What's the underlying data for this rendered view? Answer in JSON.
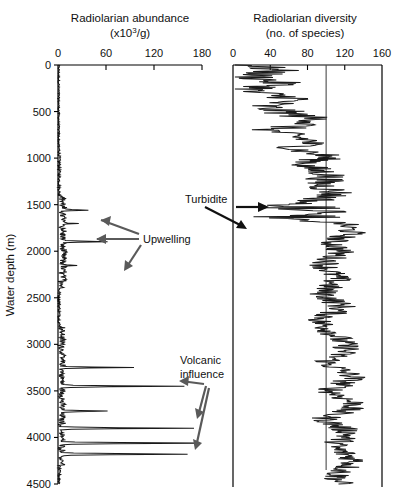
{
  "figure": {
    "depth_axis_label": "Water depth (m)",
    "depth_ticks": [
      0,
      500,
      1000,
      1500,
      2000,
      2500,
      3000,
      3500,
      4000,
      4500
    ]
  },
  "panels": {
    "left": {
      "title_line1": "Radiolarian abundance",
      "title_line2_pre": "(x10",
      "title_line2_sup": "3",
      "title_line2_post": "/g)",
      "ticks": [
        0,
        60,
        120,
        180
      ]
    },
    "right": {
      "title_line1": "Radiolarian diversity",
      "title_line2": "(no. of species)",
      "ticks": [
        0,
        40,
        80,
        120,
        160
      ]
    }
  },
  "annotations": [
    {
      "name": "upwelling",
      "label": "Upwelling",
      "x": 143,
      "y": 239
    },
    {
      "name": "volcanic-influence",
      "label_line1": "Volcanic",
      "label_line2": "influence",
      "x": 180,
      "y": 361
    },
    {
      "name": "turbidite",
      "label": "Turbidite",
      "x": 185,
      "y": 200
    }
  ],
  "chart_data": [
    {
      "type": "line",
      "name": "radiolarian-abundance",
      "title": "Radiolarian abundance (x10^3/g)",
      "xlabel": "Radiolarian abundance (x10^3/g)",
      "ylabel": "Water depth (m)",
      "xlim": [
        0,
        180
      ],
      "ylim": [
        0,
        4500
      ],
      "y_inverted": true,
      "grid": false,
      "legend": "none",
      "x": [
        0,
        0,
        1,
        2,
        1,
        0,
        10,
        16,
        8,
        2,
        0,
        1,
        0,
        6,
        3,
        0,
        2,
        1,
        0,
        4,
        2,
        0,
        1,
        3,
        0,
        1,
        0,
        2,
        1,
        7,
        3,
        1,
        0,
        2,
        0,
        1,
        0,
        2,
        8,
        4,
        1,
        0,
        3,
        1,
        0,
        2,
        0,
        1,
        0,
        5,
        2,
        0,
        1,
        0,
        2,
        0,
        1,
        0,
        3,
        1,
        0,
        2,
        0,
        1,
        0,
        24,
        10,
        3,
        14,
        6,
        2,
        10,
        5,
        12,
        3,
        9,
        4,
        2,
        0,
        1,
        0,
        4,
        1,
        0,
        2,
        12,
        6,
        2,
        18,
        7,
        3,
        1,
        0,
        3,
        0,
        2,
        0,
        1,
        0,
        13,
        6,
        2,
        9,
        4,
        1,
        0,
        2,
        0,
        1,
        0,
        26,
        12,
        5,
        2,
        18,
        9,
        3,
        1,
        0,
        2,
        0,
        38,
        18,
        6,
        2,
        1,
        0,
        3,
        1,
        0,
        2,
        0,
        1,
        0,
        3,
        1,
        0,
        2,
        0,
        1,
        0,
        4,
        2,
        0,
        1,
        0,
        3,
        1,
        0,
        2,
        0,
        1,
        0,
        6,
        2,
        0,
        3,
        1,
        0,
        2,
        0,
        11,
        5,
        2,
        0,
        1,
        0,
        3,
        1,
        0,
        2,
        0,
        5,
        2,
        0,
        1,
        0,
        3,
        1,
        0,
        2,
        0,
        1,
        0,
        4,
        2,
        0,
        1,
        0,
        2,
        0,
        1,
        0,
        3,
        1,
        0,
        2,
        0,
        4,
        2,
        0,
        1,
        0,
        3,
        1,
        0,
        2,
        0,
        1,
        0,
        2,
        0,
        1,
        0,
        22,
        9,
        3,
        1,
        0,
        2,
        0,
        13,
        5,
        2,
        0,
        1,
        0,
        3,
        1,
        0,
        28,
        11,
        4,
        1,
        0,
        2,
        0,
        1,
        0,
        3,
        1,
        0,
        2,
        0,
        1,
        0,
        2,
        0,
        4,
        1,
        0,
        2,
        0,
        1,
        0,
        3,
        1,
        0,
        2,
        0,
        1,
        0,
        3,
        1,
        0,
        14,
        5,
        2,
        0,
        1,
        0,
        22,
        8,
        3,
        1,
        0,
        4,
        1,
        0,
        2,
        0,
        1,
        0,
        3,
        1,
        0,
        2,
        0,
        1,
        0,
        5,
        2,
        0,
        1,
        0,
        3,
        1,
        0,
        2,
        0,
        1,
        0,
        2,
        0,
        1,
        0,
        3,
        1,
        0,
        2,
        0,
        1,
        0,
        2,
        0,
        1,
        0,
        3,
        1,
        0,
        1,
        0,
        2,
        0,
        1,
        0,
        2,
        0,
        1,
        0,
        3,
        1,
        0,
        2,
        0,
        1,
        0,
        2,
        0,
        1,
        0,
        3,
        1,
        0,
        2,
        0,
        1,
        0,
        2,
        0,
        32,
        14,
        5,
        1,
        0,
        2,
        0,
        1,
        0,
        6,
        2,
        0,
        18,
        7,
        2,
        0,
        1,
        0,
        4,
        1,
        0,
        2,
        0,
        1,
        0,
        2,
        0,
        1,
        0,
        3,
        1,
        0,
        2,
        0,
        1,
        0,
        2,
        0,
        38,
        17,
        6,
        2,
        0,
        1,
        0,
        3,
        1,
        0,
        2,
        0,
        1,
        0,
        28,
        11,
        4,
        1,
        0,
        2,
        0,
        26,
        10,
        3,
        1,
        0,
        2,
        0,
        1,
        0,
        3,
        1,
        0,
        2,
        0,
        1,
        0,
        2,
        0,
        1,
        0,
        4,
        1,
        0,
        2,
        0,
        1,
        0,
        34,
        14,
        5,
        1,
        0,
        3,
        1,
        0,
        2,
        0,
        1,
        0,
        18,
        7,
        2,
        0,
        1,
        0,
        22,
        9,
        3,
        1,
        0,
        2,
        0,
        1,
        0,
        3,
        1,
        0,
        2,
        0,
        1,
        0,
        48,
        20,
        7,
        2,
        0,
        1,
        0,
        3,
        1,
        0,
        2,
        0,
        156,
        60,
        16,
        4,
        1,
        0,
        2,
        0,
        1,
        0,
        3,
        1,
        0,
        10,
        3,
        0,
        1,
        0,
        2,
        0,
        1,
        0,
        8,
        3,
        0,
        2,
        0,
        1,
        0,
        42,
        16,
        5,
        1,
        0,
        2,
        0,
        1,
        0,
        3,
        1,
        0,
        2,
        0,
        1,
        0,
        5,
        2,
        0,
        1,
        0,
        3,
        1,
        0,
        2,
        0,
        1,
        0,
        2,
        0,
        1,
        0,
        3,
        1,
        0,
        2,
        0,
        1,
        0,
        4,
        1,
        0,
        2,
        0,
        1,
        0,
        3,
        1,
        0,
        2,
        0,
        1,
        0,
        2,
        0,
        1,
        0,
        4,
        1,
        0,
        2,
        0,
        1,
        0,
        3,
        1,
        0,
        2,
        0,
        1,
        0,
        2,
        0,
        1,
        0,
        3,
        1,
        0,
        2,
        0,
        1,
        0,
        5,
        2,
        0,
        1,
        0,
        3,
        1,
        0,
        2,
        0,
        1,
        0,
        2,
        0,
        1,
        0,
        3,
        1,
        0,
        2,
        0,
        1,
        0,
        2,
        0,
        1,
        0,
        3,
        1,
        0,
        2,
        0,
        1,
        0,
        4,
        1,
        0,
        2,
        0,
        1,
        0,
        3,
        1,
        0,
        2,
        0,
        1,
        0,
        2,
        0,
        1,
        0,
        3,
        1,
        0,
        2,
        0,
        1,
        0,
        2,
        0,
        14,
        5,
        1,
        0,
        2,
        0,
        1,
        0,
        3,
        1,
        0,
        2,
        0,
        1,
        0,
        2,
        0,
        1,
        0,
        4,
        1,
        0,
        2,
        0,
        1,
        0,
        3,
        1,
        0,
        2,
        0,
        1,
        0,
        8,
        3,
        0,
        1,
        0,
        2,
        0,
        1,
        0,
        3,
        1,
        0,
        2,
        0,
        1,
        0,
        2,
        0,
        1,
        0,
        3,
        1,
        0,
        2,
        0,
        1,
        0,
        2,
        0,
        1,
        0,
        4,
        1,
        0,
        2,
        0,
        1,
        0,
        3,
        1,
        0,
        2,
        0,
        1,
        0,
        2,
        0,
        1,
        0,
        3,
        1,
        0,
        2,
        0,
        1,
        0,
        2,
        0,
        1,
        0,
        3,
        1,
        0,
        2,
        0,
        1,
        0,
        5,
        2,
        0,
        1,
        0,
        3,
        1,
        0,
        2,
        0,
        1,
        0,
        2,
        0,
        1,
        0,
        3,
        1,
        0,
        2,
        0,
        1,
        0,
        2,
        0,
        1,
        0,
        3,
        1,
        0,
        2,
        0,
        1,
        0,
        4,
        1,
        0,
        2,
        0,
        1,
        0,
        3,
        1,
        0,
        2,
        0,
        1,
        0,
        2,
        0,
        1,
        0,
        3,
        1,
        0,
        2,
        0,
        1,
        0,
        2,
        0,
        1,
        0,
        3,
        1,
        0,
        2,
        0,
        1,
        0,
        2,
        0,
        1,
        0,
        3,
        1,
        0,
        2,
        0,
        1,
        0,
        2,
        0,
        1,
        0,
        3,
        1,
        0,
        2,
        0,
        1,
        0,
        2,
        0,
        1,
        0,
        3,
        1,
        0,
        2,
        0,
        1,
        0,
        2,
        0,
        1,
        0,
        3,
        1,
        0,
        2,
        0,
        1,
        0,
        2,
        0,
        1,
        0,
        3,
        1,
        0,
        2,
        0,
        1,
        0,
        2,
        0,
        1,
        0,
        12,
        4,
        1,
        0,
        2,
        0,
        1,
        0,
        3,
        1,
        0,
        2,
        0,
        1,
        0,
        2,
        0,
        1,
        0,
        3,
        1,
        0,
        2,
        0,
        1,
        0,
        2,
        0,
        1,
        0,
        16,
        6,
        2,
        0,
        1,
        0,
        3,
        1,
        0,
        2,
        0,
        1,
        0,
        2,
        0,
        1,
        0,
        3,
        1,
        0,
        2,
        0,
        1,
        0,
        2,
        0,
        1,
        0,
        3,
        1,
        0,
        2,
        0,
        1,
        0,
        2,
        0,
        1,
        0,
        3,
        1,
        0,
        2,
        0,
        1,
        0,
        2,
        0,
        1,
        0,
        3,
        1,
        0,
        2,
        0,
        1,
        0,
        2,
        0,
        1,
        0,
        3,
        1,
        0,
        2,
        0,
        1,
        0,
        2,
        0,
        1,
        0,
        28,
        11,
        4,
        1,
        0,
        2,
        0,
        1,
        0,
        20,
        8,
        2,
        0,
        1,
        0,
        3,
        1,
        0,
        2,
        0,
        1,
        0,
        2,
        0,
        1,
        0,
        40,
        15,
        5,
        1,
        0,
        2,
        0,
        1,
        0,
        3,
        1,
        0,
        2,
        0,
        1,
        0,
        2,
        0,
        62,
        24,
        8,
        2,
        0,
        1,
        0,
        3,
        1,
        0,
        2,
        0,
        1,
        0,
        2,
        0,
        1,
        0,
        3,
        1,
        0,
        2,
        0,
        1,
        0,
        34,
        13,
        4,
        1,
        0,
        2,
        0,
        1,
        0,
        3,
        1,
        0,
        2,
        0,
        1,
        0,
        2,
        0,
        1,
        0,
        52,
        20,
        6,
        2,
        0,
        1,
        0,
        3,
        1,
        0,
        2,
        0,
        1,
        0,
        2,
        0,
        1,
        0,
        3,
        1,
        0,
        2,
        0,
        1,
        0,
        2,
        0,
        1,
        0,
        3,
        1,
        0,
        2,
        0,
        1,
        0,
        2,
        0,
        1,
        0,
        3,
        1,
        0,
        2,
        0,
        1,
        0,
        2,
        0,
        1,
        0,
        3,
        1,
        0,
        2,
        0,
        1,
        0,
        2,
        0,
        1,
        0,
        3,
        1,
        0,
        2,
        0,
        1,
        0,
        2,
        0,
        1,
        0,
        3,
        1,
        0,
        2,
        0,
        1,
        0,
        2,
        0,
        1,
        0,
        3,
        1,
        0,
        2,
        0,
        1,
        0,
        2,
        0,
        1,
        0,
        3,
        1,
        0,
        2,
        0,
        1,
        0,
        2,
        0,
        1,
        0,
        3,
        1,
        0,
        2,
        0,
        1,
        0,
        2,
        0,
        1,
        0,
        3,
        1,
        0,
        2,
        0,
        1,
        0,
        2,
        0,
        1,
        0,
        3,
        1,
        0,
        2,
        0,
        1,
        0,
        2,
        0,
        1,
        0,
        3,
        1,
        0,
        2,
        0,
        1,
        0,
        2,
        0,
        1,
        0,
        3,
        1,
        0,
        2,
        0,
        1,
        0,
        2,
        0,
        1,
        0,
        3,
        1,
        0,
        2,
        0,
        1,
        0,
        2,
        0,
        1,
        0
      ],
      "y": null,
      "y_start": 0,
      "y_step": 4.5,
      "notes": "Abundance near zero through most of column; prominent spikes at ~1550, 1700, 1900, 2150, 3250, 3450, 3700, 3900, 4050, 4150 m; largest excursions ~150-165 x10^3/g in the 3400-4200 m interval.",
      "key_peaks": [
        {
          "depth": 1560,
          "value": 38
        },
        {
          "depth": 1700,
          "value": 26
        },
        {
          "depth": 1900,
          "value": 62
        },
        {
          "depth": 2150,
          "value": 24
        },
        {
          "depth": 3250,
          "value": 95
        },
        {
          "depth": 3450,
          "value": 158
        },
        {
          "depth": 3720,
          "value": 62
        },
        {
          "depth": 3900,
          "value": 170
        },
        {
          "depth": 4060,
          "value": 175
        },
        {
          "depth": 4180,
          "value": 162
        }
      ]
    },
    {
      "type": "line",
      "name": "radiolarian-diversity",
      "title": "Radiolarian diversity (no. of species)",
      "xlabel": "Radiolarian diversity (no. of species)",
      "ylabel": "Water depth (m)",
      "xlim": [
        0,
        160
      ],
      "ylim": [
        0,
        4500
      ],
      "y_inverted": true,
      "grid": false,
      "legend": "none",
      "reference_line_x": 100,
      "notes": "Diversity rises from ~20-45 species near seafloor top of column to ~90-140 species below 1500 m; low-diversity excursions at ~1530 and ~1630 m marked as turbidites.",
      "key_points": [
        {
          "depth": 0,
          "value": 22
        },
        {
          "depth": 60,
          "value": 46
        },
        {
          "depth": 120,
          "value": 20
        },
        {
          "depth": 200,
          "value": 52
        },
        {
          "depth": 280,
          "value": 14
        },
        {
          "depth": 360,
          "value": 70
        },
        {
          "depth": 440,
          "value": 30
        },
        {
          "depth": 520,
          "value": 60
        },
        {
          "depth": 600,
          "value": 96
        },
        {
          "depth": 700,
          "value": 40
        },
        {
          "depth": 820,
          "value": 86
        },
        {
          "depth": 900,
          "value": 66
        },
        {
          "depth": 980,
          "value": 102
        },
        {
          "depth": 1080,
          "value": 76
        },
        {
          "depth": 1180,
          "value": 104
        },
        {
          "depth": 1280,
          "value": 94
        },
        {
          "depth": 1380,
          "value": 112
        },
        {
          "depth": 1460,
          "value": 88
        },
        {
          "depth": 1530,
          "value": 34
        },
        {
          "depth": 1580,
          "value": 120
        },
        {
          "depth": 1630,
          "value": 26
        },
        {
          "depth": 1700,
          "value": 118
        },
        {
          "depth": 1800,
          "value": 128
        },
        {
          "depth": 1900,
          "value": 106
        },
        {
          "depth": 2000,
          "value": 116
        },
        {
          "depth": 2150,
          "value": 98
        },
        {
          "depth": 2300,
          "value": 112
        },
        {
          "depth": 2450,
          "value": 96
        },
        {
          "depth": 2600,
          "value": 118
        },
        {
          "depth": 2750,
          "value": 92
        },
        {
          "depth": 2900,
          "value": 110
        },
        {
          "depth": 3050,
          "value": 124
        },
        {
          "depth": 3200,
          "value": 100
        },
        {
          "depth": 3350,
          "value": 130
        },
        {
          "depth": 3500,
          "value": 104
        },
        {
          "depth": 3650,
          "value": 134
        },
        {
          "depth": 3800,
          "value": 98
        },
        {
          "depth": 3950,
          "value": 126
        },
        {
          "depth": 4100,
          "value": 108
        },
        {
          "depth": 4250,
          "value": 132
        },
        {
          "depth": 4400,
          "value": 112
        }
      ]
    }
  ]
}
